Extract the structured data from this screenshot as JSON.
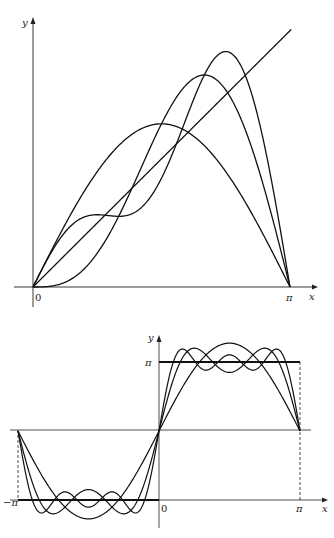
{
  "chart_data": [
    {
      "type": "line",
      "title": "",
      "description": "Fourier partial sums of f(x)=x on (0,π)",
      "xlabel": "x",
      "ylabel": "y",
      "x_ticks": [
        "0",
        "π"
      ],
      "xlim": [
        0,
        3.1416
      ],
      "ylim": [
        0,
        3.3
      ],
      "grid": false,
      "series": [
        {
          "name": "y = x",
          "formula": "x"
        },
        {
          "name": "S1",
          "formula": "2 sin x"
        },
        {
          "name": "S2",
          "formula": "2 sin x - sin 2x"
        },
        {
          "name": "S3",
          "formula": "2 sin x - sin 2x + (2/3) sin 3x"
        }
      ]
    },
    {
      "type": "line",
      "title": "",
      "description": "Fourier partial sums of a square wave: 0 on (−π,0), π on (0,π)",
      "xlabel": "x",
      "ylabel": "y",
      "x_ticks": [
        "−π",
        "0",
        "π"
      ],
      "y_ticks": [
        "π"
      ],
      "xlim": [
        -3.1416,
        3.1416
      ],
      "ylim": [
        -0.5,
        3.6
      ],
      "grid": false,
      "series": [
        {
          "name": "step",
          "formula": "0 for x<0, π for x>0"
        },
        {
          "name": "S1",
          "formula": "π/2 + 2 sin x"
        },
        {
          "name": "S3",
          "formula": "π/2 + 2(sin x + sin 3x/3)"
        },
        {
          "name": "S5",
          "formula": "π/2 + 2(sin x + sin 3x/3 + sin 5x/5)"
        }
      ]
    }
  ],
  "top": {
    "y_label": "y",
    "x_label": "x",
    "origin_label": "0",
    "pi_label": "π"
  },
  "bottom": {
    "y_label": "y",
    "x_label": "x",
    "origin_label": "0",
    "pi_label": "π",
    "neg_pi_label": "−π",
    "y_pi_label": "π"
  }
}
